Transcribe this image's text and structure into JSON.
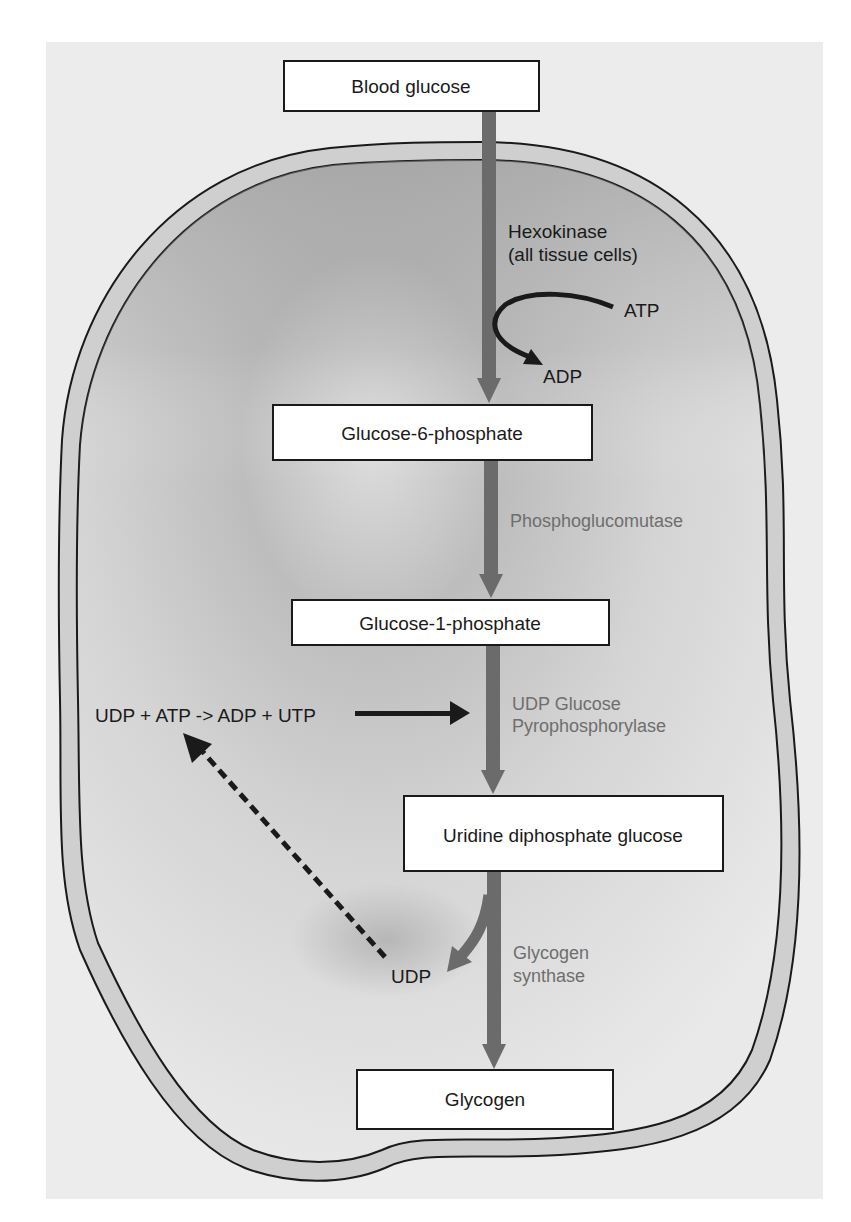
{
  "diagram": {
    "colors": {
      "background_panel": "#ececec",
      "membrane_fill": "#cfcfcf",
      "cytoplasm_dark": "#9e9e9e",
      "cytoplasm_light": "#e6e6e6",
      "pathway_arrow": "#6b6b6b",
      "box_fill": "#ffffff",
      "outline": "#1a1a1a",
      "enzyme_text": "#6e6e6e"
    },
    "nodes": [
      {
        "id": "blood-glucose",
        "label": "Blood glucose"
      },
      {
        "id": "glucose-6-phosphate",
        "label": "Glucose-6-phosphate"
      },
      {
        "id": "glucose-1-phosphate",
        "label": "Glucose-1-phosphate"
      },
      {
        "id": "udp-glucose",
        "label": "Uridine diphosphate glucose"
      },
      {
        "id": "glycogen",
        "label": "Glycogen"
      }
    ],
    "enzymes": {
      "hexokinase": {
        "line1": "Hexokinase",
        "line2": "(all tissue cells)"
      },
      "phosphoglucomutase": {
        "line1": "Phosphoglucomutase"
      },
      "udp_pyrophosphorylase": {
        "line1": "UDP Glucose",
        "line2": "Pyrophosphorylase"
      },
      "glycogen_synthase": {
        "line1": "Glycogen",
        "line2": "synthase"
      }
    },
    "cofactors": {
      "atp": "ATP",
      "adp": "ADP",
      "udp": "UDP",
      "utp_regeneration": "UDP + ATP -> ADP + UTP"
    }
  }
}
